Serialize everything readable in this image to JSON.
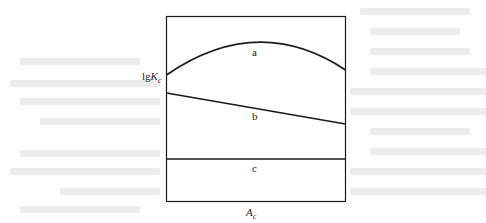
{
  "figure": {
    "y_axis_label": {
      "base": "lg",
      "var": "K",
      "sub": "c"
    },
    "x_axis_label": {
      "var": "A",
      "sub": "c"
    },
    "curves": [
      {
        "id": "a",
        "label": "a",
        "shape": "concave-down arc",
        "left_y": 75,
        "peak_y": 44,
        "right_y": 70
      },
      {
        "id": "b",
        "label": "b",
        "shape": "decreasing straight line",
        "left_y": 93,
        "right_y": 124
      },
      {
        "id": "c",
        "label": "c",
        "shape": "horizontal straight line",
        "y": 159
      }
    ],
    "frame": {
      "x": 166,
      "y": 16,
      "width": 179,
      "height": 185
    },
    "line_color": "#1a1a1a"
  }
}
